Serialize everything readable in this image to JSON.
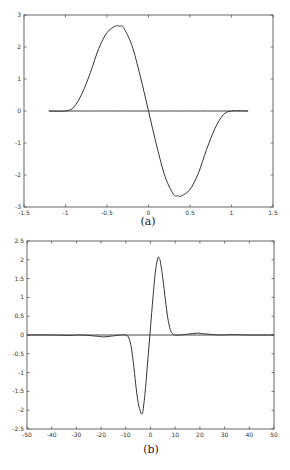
{
  "chart_data": [
    {
      "type": "line",
      "caption": "(a)",
      "title": "",
      "xlabel": "",
      "ylabel": "",
      "xlim": [
        -1.5,
        1.5
      ],
      "ylim": [
        -3,
        3
      ],
      "xticks": [
        -1.5,
        -1,
        -0.5,
        0,
        0.5,
        1,
        1.5
      ],
      "xtick_labels": [
        "-1.5",
        "-1",
        "-0.5",
        "0",
        "0.5",
        "1",
        "1.5"
      ],
      "yticks": [
        -3,
        -2,
        -1,
        0,
        1,
        2,
        3
      ],
      "ytick_labels": [
        "-3",
        "-2",
        "-1",
        "0",
        "1",
        "2",
        "3"
      ],
      "grid": false,
      "series": [
        {
          "name": "curve",
          "x": [
            -1.2,
            -1.0,
            -0.9,
            -0.8,
            -0.7,
            -0.6,
            -0.5,
            -0.4,
            -0.35,
            -0.3,
            -0.2,
            -0.1,
            0,
            0.1,
            0.2,
            0.3,
            0.35,
            0.4,
            0.5,
            0.6,
            0.7,
            0.8,
            0.9,
            1.0,
            1.2
          ],
          "y": [
            0,
            0,
            0.12,
            0.55,
            1.2,
            1.95,
            2.45,
            2.65,
            2.65,
            2.6,
            2.05,
            1.1,
            0,
            -1.1,
            -2.05,
            -2.6,
            -2.65,
            -2.65,
            -2.45,
            -1.95,
            -1.2,
            -0.55,
            -0.12,
            0,
            0
          ]
        },
        {
          "name": "zero-line",
          "x": [
            -1.2,
            1.2
          ],
          "y": [
            0,
            0
          ]
        }
      ]
    },
    {
      "type": "line",
      "caption": "(b)",
      "title": "",
      "xlabel": "",
      "ylabel": "",
      "xlim": [
        -50,
        50
      ],
      "ylim": [
        -2.5,
        2.5
      ],
      "xticks": [
        -50,
        -40,
        -30,
        -20,
        -10,
        0,
        10,
        20,
        30,
        40,
        50
      ],
      "xtick_labels": [
        "-50",
        "-40",
        "-30",
        "-20",
        "-10",
        "0",
        "10",
        "20",
        "30",
        "40",
        "50"
      ],
      "yticks": [
        -2.5,
        -2,
        -1.5,
        -1,
        -0.5,
        0,
        0.5,
        1,
        1.5,
        2,
        2.5
      ],
      "ytick_labels": [
        "-2.5",
        "-2",
        "-1.5",
        "-1",
        "-0.5",
        "0",
        "0.5",
        "1",
        "1.5",
        "2",
        "2.5"
      ],
      "grid": false,
      "series": [
        {
          "name": "curve",
          "x": [
            -50,
            -40,
            -33,
            -28,
            -22,
            -19,
            -16,
            -12,
            -10,
            -9,
            -8,
            -7,
            -6,
            -5,
            -4,
            -3.5,
            -3,
            -2,
            -1,
            0,
            1,
            2,
            3,
            3.5,
            4,
            5,
            6,
            7,
            8,
            9,
            10,
            12,
            16,
            19,
            22,
            28,
            33,
            40,
            50
          ],
          "y": [
            0,
            0,
            -0.01,
            0,
            -0.03,
            -0.05,
            -0.03,
            0,
            0,
            -0.05,
            -0.25,
            -0.7,
            -1.3,
            -1.8,
            -2.05,
            -2.1,
            -2.0,
            -1.4,
            -0.6,
            0.2,
            1.0,
            1.7,
            2.05,
            2.05,
            1.95,
            1.5,
            0.95,
            0.45,
            0.15,
            0.03,
            0,
            0,
            0.03,
            0.05,
            0.03,
            0,
            0.01,
            0,
            0
          ]
        },
        {
          "name": "zero-line",
          "x": [
            -50,
            50
          ],
          "y": [
            0,
            0
          ]
        }
      ]
    }
  ],
  "captions": {
    "a": "(a)",
    "b": "(b)"
  }
}
